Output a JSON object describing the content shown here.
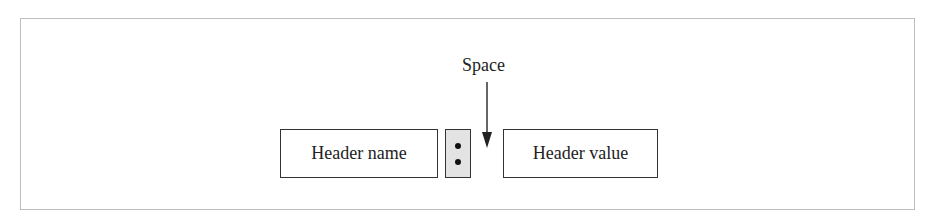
{
  "diagram": {
    "label_space": "Space",
    "boxes": [
      {
        "id": "name",
        "label": "Header name"
      },
      {
        "id": "colon",
        "label": ":"
      },
      {
        "id": "value",
        "label": "Header value"
      }
    ],
    "colors": {
      "frame": "#bdbdbd",
      "box_border": "#333333",
      "colon_fill": "#e3e3e3",
      "text": "#222222"
    }
  }
}
